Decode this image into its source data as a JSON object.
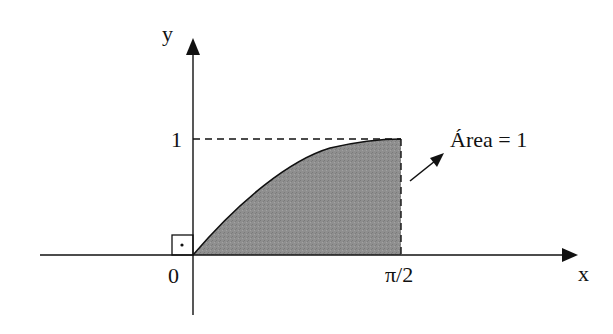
{
  "diagram": {
    "type": "function-area",
    "function": "sin(x)",
    "axes": {
      "x_label": "x",
      "y_label": "y",
      "origin_label": "0",
      "x_tick_label": "π/2",
      "y_tick_label": "1"
    },
    "annotation": {
      "text": "Área = 1"
    },
    "colors": {
      "fill": "#8a8a8a",
      "stroke": "#111111"
    }
  }
}
